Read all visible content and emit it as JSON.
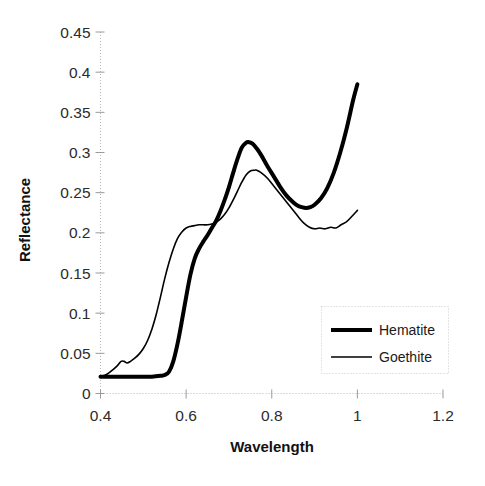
{
  "chart_data": {
    "type": "line",
    "title": "",
    "xlabel": "Wavelength",
    "ylabel": "Reflectance",
    "xlim": [
      0.4,
      1.2
    ],
    "ylim": [
      0,
      0.45
    ],
    "xticks": [
      "0.4",
      "0.6",
      "0.8",
      "1",
      "1.2"
    ],
    "xtick_values": [
      0.4,
      0.6,
      0.8,
      1.0,
      1.2
    ],
    "yticks": [
      "0",
      "0.05",
      "0.1",
      "0.15",
      "0.2",
      "0.25",
      "0.3",
      "0.35",
      "0.4",
      "0.45"
    ],
    "ytick_values": [
      0,
      0.05,
      0.1,
      0.15,
      0.2,
      0.25,
      0.3,
      0.35,
      0.4,
      0.45
    ],
    "grid": false,
    "legend_position": "lower-right",
    "series": [
      {
        "name": "Hematite",
        "style": "thick-solid-black",
        "color": "#000000",
        "line_width": 4.0,
        "x": [
          0.4,
          0.42,
          0.44,
          0.46,
          0.48,
          0.5,
          0.52,
          0.54,
          0.55,
          0.56,
          0.57,
          0.58,
          0.59,
          0.6,
          0.61,
          0.62,
          0.63,
          0.64,
          0.65,
          0.66,
          0.67,
          0.68,
          0.69,
          0.7,
          0.71,
          0.72,
          0.73,
          0.74,
          0.745,
          0.755,
          0.765,
          0.775,
          0.79,
          0.805,
          0.82,
          0.835,
          0.85,
          0.86,
          0.87,
          0.88,
          0.89,
          0.9,
          0.915,
          0.93,
          0.945,
          0.96,
          0.975,
          0.99,
          1.0
        ],
        "y": [
          0.021,
          0.021,
          0.021,
          0.021,
          0.021,
          0.021,
          0.021,
          0.022,
          0.023,
          0.027,
          0.04,
          0.062,
          0.09,
          0.12,
          0.148,
          0.168,
          0.18,
          0.189,
          0.197,
          0.206,
          0.215,
          0.227,
          0.241,
          0.257,
          0.275,
          0.292,
          0.306,
          0.312,
          0.313,
          0.311,
          0.305,
          0.297,
          0.283,
          0.27,
          0.257,
          0.246,
          0.238,
          0.234,
          0.232,
          0.231,
          0.232,
          0.235,
          0.243,
          0.256,
          0.275,
          0.3,
          0.33,
          0.365,
          0.385
        ]
      },
      {
        "name": "Goethite",
        "style": "thin-solid-black",
        "color": "#000000",
        "line_width": 1.6,
        "x": [
          0.4,
          0.415,
          0.43,
          0.44,
          0.448,
          0.455,
          0.462,
          0.47,
          0.48,
          0.49,
          0.5,
          0.51,
          0.52,
          0.53,
          0.54,
          0.55,
          0.56,
          0.57,
          0.58,
          0.59,
          0.6,
          0.61,
          0.62,
          0.63,
          0.64,
          0.65,
          0.66,
          0.67,
          0.68,
          0.69,
          0.7,
          0.71,
          0.72,
          0.73,
          0.74,
          0.75,
          0.76,
          0.765,
          0.775,
          0.79,
          0.805,
          0.82,
          0.835,
          0.85,
          0.862,
          0.875,
          0.888,
          0.9,
          0.912,
          0.925,
          0.938,
          0.95,
          0.962,
          0.975,
          0.988,
          1.0
        ],
        "y": [
          0.021,
          0.024,
          0.03,
          0.035,
          0.04,
          0.04,
          0.038,
          0.04,
          0.044,
          0.049,
          0.056,
          0.066,
          0.08,
          0.098,
          0.12,
          0.143,
          0.163,
          0.18,
          0.193,
          0.201,
          0.206,
          0.208,
          0.209,
          0.21,
          0.21,
          0.21,
          0.211,
          0.213,
          0.217,
          0.223,
          0.231,
          0.241,
          0.252,
          0.263,
          0.272,
          0.277,
          0.278,
          0.278,
          0.275,
          0.268,
          0.258,
          0.248,
          0.238,
          0.228,
          0.22,
          0.212,
          0.207,
          0.205,
          0.206,
          0.205,
          0.207,
          0.206,
          0.21,
          0.214,
          0.221,
          0.228
        ]
      }
    ],
    "annotations": []
  },
  "legend": {
    "items": [
      {
        "label": "Hematite",
        "swatch": "thick-line-swatch"
      },
      {
        "label": "Goethite",
        "swatch": "thin-line-swatch"
      }
    ]
  }
}
